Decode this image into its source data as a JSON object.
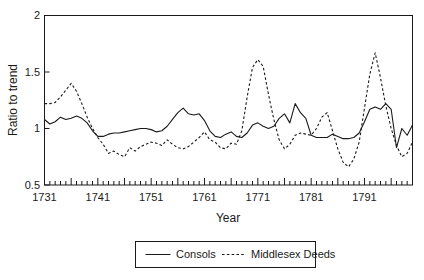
{
  "chart_data": {
    "type": "line",
    "title": "",
    "xlabel": "Year",
    "ylabel": "Ratio to trend",
    "xlim": [
      1731,
      1800
    ],
    "ylim": [
      0.5,
      2
    ],
    "yticks": [
      0.5,
      1,
      1.5,
      2
    ],
    "yticklabels": [
      "0.5",
      "1",
      "1.5",
      "2"
    ],
    "xticks": [
      1731,
      1741,
      1751,
      1761,
      1771,
      1781,
      1791
    ],
    "xticklabels": [
      "1731",
      "1741",
      "1751",
      "1761",
      "1771",
      "1781",
      "1791"
    ],
    "minor_tick_interval": 1,
    "major_tick_interval": 5,
    "grid": false,
    "legend_position": "below-outside",
    "x": [
      1731,
      1732,
      1733,
      1734,
      1735,
      1736,
      1737,
      1738,
      1739,
      1740,
      1741,
      1742,
      1743,
      1744,
      1745,
      1746,
      1747,
      1748,
      1749,
      1750,
      1751,
      1752,
      1753,
      1754,
      1755,
      1756,
      1757,
      1758,
      1759,
      1760,
      1761,
      1762,
      1763,
      1764,
      1765,
      1766,
      1767,
      1768,
      1769,
      1770,
      1771,
      1772,
      1773,
      1774,
      1775,
      1776,
      1777,
      1778,
      1779,
      1780,
      1781,
      1782,
      1783,
      1784,
      1785,
      1786,
      1787,
      1788,
      1789,
      1790,
      1791,
      1792,
      1793,
      1794,
      1795,
      1796,
      1797,
      1798,
      1799,
      1800
    ],
    "series": [
      {
        "name": "Consols",
        "style": "solid",
        "values": [
          1.08,
          1.04,
          1.06,
          1.1,
          1.08,
          1.09,
          1.11,
          1.09,
          1.05,
          0.98,
          0.93,
          0.93,
          0.95,
          0.96,
          0.96,
          0.97,
          0.98,
          0.99,
          1.0,
          1.0,
          0.99,
          0.97,
          0.98,
          1.02,
          1.08,
          1.14,
          1.18,
          1.13,
          1.12,
          1.13,
          1.07,
          0.98,
          0.93,
          0.92,
          0.95,
          0.97,
          0.93,
          0.92,
          0.96,
          1.03,
          1.05,
          1.02,
          1.0,
          1.02,
          1.09,
          1.13,
          1.05,
          1.22,
          1.14,
          1.09,
          0.94,
          0.92,
          0.92,
          0.92,
          0.95,
          0.93,
          0.91,
          0.91,
          0.92,
          0.96,
          1.06,
          1.17,
          1.19,
          1.17,
          1.22,
          1.17,
          0.83,
          1.0,
          0.94,
          1.03
        ],
        "note": "Consols price index expressed as ratio to trend"
      },
      {
        "name": "Middlesex Deeds",
        "style": "dotted",
        "values": [
          1.22,
          1.22,
          1.23,
          1.28,
          1.34,
          1.4,
          1.33,
          1.22,
          1.1,
          1.0,
          0.92,
          0.86,
          0.78,
          0.8,
          0.77,
          0.75,
          0.83,
          0.8,
          0.84,
          0.86,
          0.88,
          0.87,
          0.85,
          0.9,
          0.86,
          0.83,
          0.82,
          0.84,
          0.88,
          0.92,
          0.97,
          0.9,
          0.88,
          0.83,
          0.82,
          0.87,
          0.86,
          0.98,
          1.28,
          1.54,
          1.61,
          1.55,
          1.3,
          1.08,
          0.9,
          0.82,
          0.86,
          0.94,
          0.96,
          0.95,
          0.94,
          1.0,
          1.1,
          1.14,
          0.98,
          0.82,
          0.7,
          0.66,
          0.73,
          0.88,
          1.18,
          1.48,
          1.67,
          1.45,
          1.2,
          1.0,
          0.85,
          0.75,
          0.78,
          0.88
        ],
        "note": "Middlesex Deeds registrations expressed as ratio to trend"
      }
    ]
  },
  "legend": {
    "items": [
      {
        "label": "Consols",
        "style": "solid"
      },
      {
        "label": "Middlesex Deeds",
        "style": "dotted"
      }
    ]
  }
}
